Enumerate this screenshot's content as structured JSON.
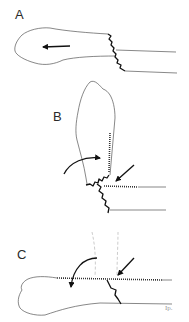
{
  "figure": {
    "panels": [
      {
        "id": "A",
        "label": "A"
      },
      {
        "id": "B",
        "label": "B"
      },
      {
        "id": "C",
        "label": "C"
      }
    ],
    "signature": "Ip.",
    "colors": {
      "outline": "#555555",
      "fracture_line": "#111111",
      "arrow": "#111111",
      "guide_dashed": "#aaaaaa"
    }
  }
}
